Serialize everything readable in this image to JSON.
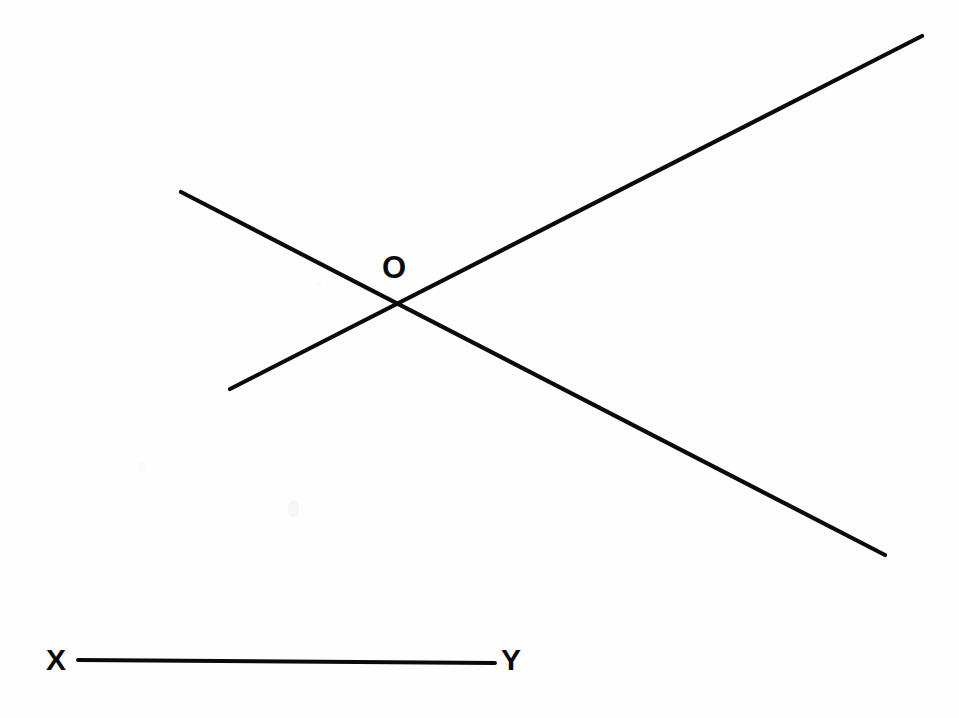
{
  "figure": {
    "background_color": "#fefefe",
    "stroke_color": "#0a0a0a",
    "width": 959,
    "height": 718
  },
  "labels": {
    "intersection": "O",
    "segment_start": "X",
    "segment_end": "Y"
  },
  "geometry": {
    "lines": [
      {
        "name": "ascending-line",
        "from": {
          "x": 230,
          "y": 389
        },
        "to": {
          "x": 922,
          "y": 36
        },
        "stroke_width": 4.2,
        "direction": "rising left-to-right"
      },
      {
        "name": "descending-line",
        "from": {
          "x": 181,
          "y": 192
        },
        "to": {
          "x": 885,
          "y": 555
        },
        "stroke_width": 4.2,
        "direction": "falling left-to-right"
      },
      {
        "name": "segment-xy",
        "from": {
          "x": 78,
          "y": 660
        },
        "to": {
          "x": 495,
          "y": 663
        },
        "stroke_width": 4.0,
        "direction": "horizontal"
      }
    ],
    "intersection_point": {
      "x": 396,
      "y": 308
    }
  },
  "chart_data": {
    "type": "line",
    "xlabel": "",
    "ylabel": "",
    "xlim": [
      0,
      959
    ],
    "ylim": [
      718,
      0
    ],
    "grid": false,
    "legend": null,
    "series": [
      {
        "name": "ascending-line",
        "x": [
          230,
          922
        ],
        "y": [
          389,
          36
        ]
      },
      {
        "name": "descending-line",
        "x": [
          181,
          885
        ],
        "y": [
          192,
          555
        ]
      },
      {
        "name": "segment-xy",
        "x": [
          78,
          495
        ],
        "y": [
          660,
          663
        ]
      }
    ],
    "annotations": [
      {
        "text": "O",
        "x": 396,
        "y": 268
      },
      {
        "text": "X",
        "x": 58,
        "y": 662
      },
      {
        "text": "Y",
        "x": 515,
        "y": 662
      }
    ]
  }
}
